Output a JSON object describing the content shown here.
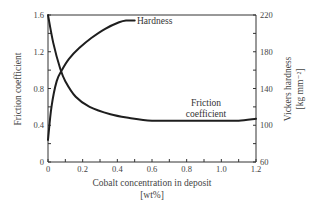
{
  "chart_data": {
    "type": "line",
    "title": "",
    "xlabel": "Cobalt concentration in deposit",
    "xlabel_unit": "[wt%]",
    "ylabel": "Friction coefficient",
    "y2label": "Vickers hardness",
    "y2label_unit": "[kg mm⁻²]",
    "xlim": [
      0,
      1.2
    ],
    "ylim": [
      0,
      1.6
    ],
    "y2lim": [
      60,
      220
    ],
    "x_ticks": [
      "0",
      "0.2",
      "0.4",
      "0.6",
      "0.8",
      "1.0",
      "1.2"
    ],
    "y_ticks": [
      "0",
      "0.4",
      "0.8",
      "1.2",
      "1.6"
    ],
    "y2_ticks": [
      "60",
      "100",
      "140",
      "180",
      "220"
    ],
    "grid": false,
    "legend": "none (curves labeled inline)",
    "series": [
      {
        "name": "Hardness",
        "axis": "right",
        "x": [
          0.0,
          0.02,
          0.05,
          0.08,
          0.12,
          0.18,
          0.25,
          0.33,
          0.41,
          0.45,
          0.5
        ],
        "values": [
          84,
          120,
          148,
          160,
          172,
          184,
          195,
          205,
          212,
          214,
          214
        ]
      },
      {
        "name": "Friction coefficient",
        "axis": "left",
        "x": [
          0.0,
          0.03,
          0.07,
          0.1,
          0.16,
          0.24,
          0.36,
          0.47,
          0.6,
          0.8,
          1.0,
          1.1,
          1.2
        ],
        "values": [
          1.6,
          1.3,
          1.02,
          0.88,
          0.71,
          0.6,
          0.52,
          0.48,
          0.45,
          0.45,
          0.45,
          0.45,
          0.47
        ]
      }
    ],
    "annotations": [
      {
        "text": "Hardness",
        "near": "end of hardness curve (x≈0.5)"
      },
      {
        "text": "Friction coefficient",
        "near": "x≈0.85, above flat friction segment"
      }
    ]
  },
  "labels": {
    "y_axis_title": "Friction coefficient",
    "y2_axis_title_line1": "Vickers hardness",
    "y2_axis_title_line2": "[kg mm⁻²]",
    "x_axis_title_line1": "Cobalt concentration in deposit",
    "x_axis_title_line2": "[wt%]",
    "hardness_annotation": "Hardness",
    "friction_annotation_line1": "Friction",
    "friction_annotation_line2": "coefficient"
  }
}
